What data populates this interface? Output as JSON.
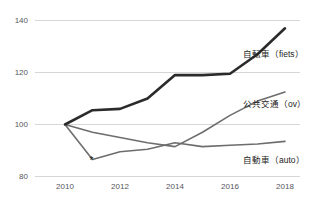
{
  "chart_data": {
    "type": "line",
    "title": "",
    "subtitle": "",
    "xlabel": "",
    "ylabel": "",
    "x": [
      2010,
      2011,
      2012,
      2013,
      2014,
      2015,
      2016,
      2017,
      2018
    ],
    "xlim": [
      2010,
      2018
    ],
    "ylim": [
      80,
      140
    ],
    "yticks": [
      80,
      100,
      120,
      140
    ],
    "ytick_labels": [
      "80",
      "100",
      "120",
      "140"
    ],
    "xticks": [
      2010,
      2012,
      2014,
      2016,
      2018
    ],
    "xtick_labels": [
      "2010",
      "2012",
      "2014",
      "2016",
      "2018"
    ],
    "grid": "horizontal",
    "legend_position": "right-inline",
    "series": [
      {
        "name": "自転車（fiets）",
        "label": "自転車（fiets）",
        "color": "#2b2b2b",
        "width": 2.6,
        "values": [
          100,
          105.5,
          106,
          110,
          119,
          119,
          119.5,
          127,
          137
        ]
      },
      {
        "name": "公共交通（ov）",
        "label": "公共交通（ov）",
        "color": "#6d6d6d",
        "width": 1.6,
        "values": [
          100,
          97,
          95,
          93,
          91.5,
          97,
          103.5,
          109,
          112.5
        ]
      },
      {
        "name": "自動車（auto）",
        "label": "自動車（auto）",
        "color": "#6d6d6d",
        "width": 1.6,
        "values": [
          100,
          86.5,
          89.5,
          90.5,
          93,
          91.5,
          92,
          92.5,
          93.5
        ]
      }
    ],
    "annotations": [
      {
        "text": "*",
        "x": 2011,
        "y": 88.5
      }
    ]
  },
  "axis": {
    "y_labels": [
      "140",
      "120",
      "100",
      "80"
    ],
    "x_labels": [
      "2010",
      "2012",
      "2014",
      "2016",
      "2018"
    ]
  },
  "labels": {
    "bicycle": "自転車（fiets）",
    "transit": "公共交通（ov）",
    "car": "自動車（auto）"
  },
  "annotation": {
    "star": "*"
  },
  "colors": {
    "bicycle_line": "#2b2b2b",
    "other_line": "#6d6d6d",
    "grid": "#d6d6d6",
    "axis_text": "#55565a",
    "label_text": "#1d1d1d",
    "background": "#ffffff"
  }
}
